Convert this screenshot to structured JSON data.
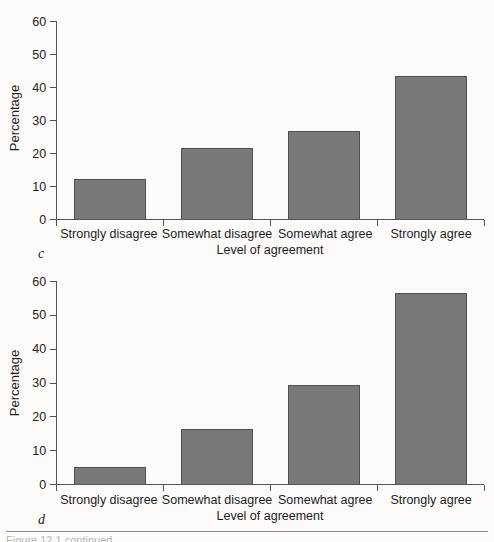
{
  "figure": {
    "panel_c_letter": "c",
    "panel_d_letter": "d",
    "caption_partial": "Figure 12.1  continued"
  },
  "colors": {
    "bar_fill": "#797977",
    "bar_stroke": "#4f4f4d",
    "axis": "#53534f",
    "background": "#fcfbf9",
    "text": "#1d1d1d"
  },
  "chart_data": [
    {
      "type": "bar",
      "panel": "c",
      "title": "",
      "xlabel": "Level of agreement",
      "ylabel": "Percentage",
      "categories": [
        "Strongly disagree",
        "Somewhat disagree",
        "Somewhat agree",
        "Strongly agree"
      ],
      "values": [
        12.0,
        21.5,
        26.8,
        43.2
      ],
      "ylim": [
        0,
        60
      ],
      "yticks": [
        0,
        10,
        20,
        30,
        40,
        50,
        60
      ],
      "ytick_labels": [
        "0",
        "10",
        "20",
        "30",
        "40",
        "50",
        "60"
      ],
      "grid": false,
      "legend": "none"
    },
    {
      "type": "bar",
      "panel": "d",
      "title": "",
      "xlabel": "Level of agreement",
      "ylabel": "Percentage",
      "categories": [
        "Strongly disagree",
        "Somewhat disagree",
        "Somewhat agree",
        "Strongly agree"
      ],
      "values": [
        5.0,
        16.3,
        29.3,
        56.5
      ],
      "ylim": [
        0,
        60
      ],
      "yticks": [
        0,
        10,
        20,
        30,
        40,
        50,
        60
      ],
      "ytick_labels": [
        "0",
        "10",
        "20",
        "30",
        "40",
        "50",
        "60"
      ],
      "grid": false,
      "legend": "none"
    }
  ]
}
